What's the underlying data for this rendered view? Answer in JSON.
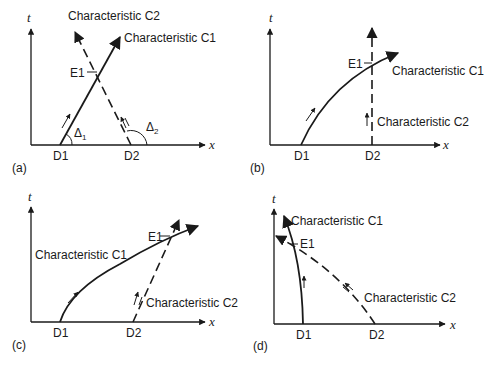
{
  "figure": {
    "panels": [
      {
        "id": "a",
        "tag": "(a)",
        "t_axis": "t",
        "x_axis": "x",
        "points": {
          "d1": "D1",
          "d2": "D2",
          "e1": "E1"
        },
        "c1": "Characteristic C1",
        "c2": "Characteristic C2",
        "angle1": "Δ",
        "angle1_sub": "1",
        "angle2": "Δ",
        "angle2_sub": "2"
      },
      {
        "id": "b",
        "tag": "(b)",
        "t_axis": "t",
        "x_axis": "x",
        "points": {
          "d1": "D1",
          "d2": "D2",
          "e1": "E1"
        },
        "c1": "Characteristic C1",
        "c2": "Characteristic C2"
      },
      {
        "id": "c",
        "tag": "(c)",
        "t_axis": "t",
        "x_axis": "x",
        "points": {
          "d1": "D1",
          "d2": "D2",
          "e1": "E1"
        },
        "c1": "Characteristic C1",
        "c2": "Characteristic C2"
      },
      {
        "id": "d",
        "tag": "(d)",
        "t_axis": "t",
        "x_axis": "x",
        "points": {
          "d1": "D1",
          "d2": "D2",
          "e1": "E1"
        },
        "c1": "Characteristic C1",
        "c2": "Characteristic C2"
      }
    ],
    "colors": {
      "ink": "#1a1a1a",
      "background": "#ffffff"
    }
  }
}
